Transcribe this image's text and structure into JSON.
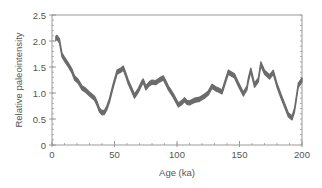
{
  "chart_data": {
    "type": "line",
    "title": "",
    "xlabel": "Age (ka)",
    "ylabel": "Relative paleointensity",
    "xlim": [
      0,
      200
    ],
    "ylim": [
      0,
      2.5
    ],
    "xticks": [
      0,
      50,
      100,
      150,
      200
    ],
    "xtick_labels": [
      "0",
      "50",
      "100",
      "150",
      "200"
    ],
    "x_minor_step": 10,
    "yticks": [
      0,
      0.5,
      1.0,
      1.5,
      2.0,
      2.5
    ],
    "ytick_labels": [
      "0",
      "0.5",
      "1.0",
      "1.5",
      "2.0",
      "2.5"
    ],
    "y_minor_step": 0.1,
    "grid": false,
    "legend": null,
    "band_half_width": 0.04,
    "series": [
      {
        "name": "Relative paleointensity",
        "color": "#6b6b6b",
        "x": [
          3,
          4,
          6,
          8,
          10,
          13,
          16,
          18,
          21,
          24,
          27,
          30,
          34,
          36,
          38,
          40,
          42,
          44,
          46,
          49,
          52,
          55,
          57,
          59,
          61,
          64,
          66,
          69,
          72,
          73,
          75,
          78,
          80,
          83,
          86,
          89,
          91,
          93,
          97,
          101,
          104,
          106,
          108,
          110,
          114,
          118,
          122,
          125,
          128,
          131,
          133,
          136,
          139,
          141,
          144,
          146,
          149,
          153,
          156,
          157,
          159,
          162,
          165,
          167,
          170,
          174,
          177,
          180,
          183,
          186,
          189,
          192,
          194,
          197,
          200
        ],
        "values": [
          2.05,
          2.07,
          2.0,
          1.73,
          1.65,
          1.54,
          1.42,
          1.29,
          1.22,
          1.1,
          1.05,
          0.98,
          0.9,
          0.8,
          0.67,
          0.62,
          0.63,
          0.72,
          0.86,
          1.15,
          1.4,
          1.44,
          1.48,
          1.35,
          1.21,
          1.05,
          0.94,
          1.05,
          1.2,
          1.23,
          1.1,
          1.18,
          1.21,
          1.2,
          1.25,
          1.29,
          1.2,
          1.1,
          0.95,
          0.77,
          0.82,
          0.87,
          0.82,
          0.81,
          0.86,
          0.88,
          0.94,
          1.0,
          1.13,
          1.08,
          1.06,
          1.02,
          1.25,
          1.4,
          1.36,
          1.33,
          1.17,
          0.98,
          1.1,
          1.25,
          1.44,
          1.15,
          1.25,
          1.56,
          1.4,
          1.31,
          1.4,
          1.15,
          0.95,
          0.77,
          0.58,
          0.52,
          0.67,
          1.15,
          1.25
        ]
      }
    ]
  }
}
